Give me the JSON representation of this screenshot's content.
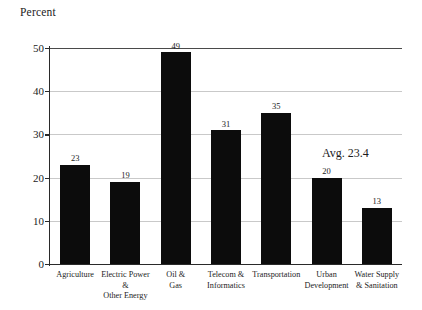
{
  "chart_data": {
    "type": "bar",
    "title": "Percent",
    "xlabel": "",
    "ylabel": "Percent",
    "ylim": [
      0,
      50
    ],
    "yticks": [
      0,
      10,
      20,
      30,
      40,
      50
    ],
    "grid": true,
    "legend": null,
    "categories": [
      "Agriculture",
      "Electric Power & Other Energy",
      "Oil & Gas",
      "Telecom & Informatics",
      "Transportation",
      "Urban Development",
      "Water Supply & Sanitation"
    ],
    "category_lines": [
      [
        "Agriculture"
      ],
      [
        "Electric Power &",
        "Other Energy"
      ],
      [
        "Oil &",
        "Gas"
      ],
      [
        "Telecom &",
        "Informatics"
      ],
      [
        "Transportation"
      ],
      [
        "Urban",
        "Development"
      ],
      [
        "Water Supply",
        "& Sanitation"
      ]
    ],
    "values": [
      23,
      19,
      49,
      31,
      35,
      20,
      13
    ],
    "value_labels": [
      "23",
      "19",
      "49",
      "31",
      "35",
      "20",
      "13"
    ],
    "annotations": [
      {
        "text": "Avg. 23.4",
        "value": 23.4
      }
    ],
    "bar_color": "#0c0c0c",
    "gridline_color": "#c9c9c9",
    "axis_color": "#2a2a2a"
  }
}
